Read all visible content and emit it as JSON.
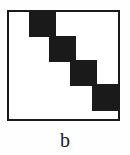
{
  "figure": {
    "caption": "b",
    "caption_font_size_px": 20,
    "caption_left_px": 0,
    "caption_top_px": 130,
    "background_color": "#fefefe"
  },
  "matrix": {
    "frame": {
      "x": 7,
      "y": 10,
      "width": 113,
      "height": 111,
      "border_width_px": 2,
      "border_color": "#1a1a1a",
      "fill_color": "#ffffff"
    },
    "block_color": "#1a1a1a",
    "block_count": 4,
    "blocks": [
      {
        "label": "block-1",
        "x": 29,
        "y": 11,
        "width": 27,
        "height": 26
      },
      {
        "label": "block-2",
        "x": 49,
        "y": 36,
        "width": 27,
        "height": 26
      },
      {
        "label": "block-3",
        "x": 70,
        "y": 60,
        "width": 27,
        "height": 26
      },
      {
        "label": "block-4",
        "x": 92,
        "y": 84,
        "width": 27,
        "height": 27
      }
    ]
  },
  "chart_data": {
    "type": "heatmap",
    "title": "b",
    "xlabel": "",
    "ylabel": "",
    "grid": false,
    "legend_position": "none",
    "xlim": [
      0,
      1
    ],
    "ylim": [
      0,
      1
    ],
    "categories": [
      "block-1",
      "block-2",
      "block-3",
      "block-4"
    ],
    "values": [
      1,
      1,
      1,
      1
    ],
    "blocks_normalized": [
      {
        "name": "block-1",
        "x0": 0.195,
        "x1": 0.434,
        "y0": 0.009,
        "y1": 0.243
      },
      {
        "name": "block-2",
        "x0": 0.372,
        "x1": 0.611,
        "y0": 0.234,
        "y1": 0.468
      },
      {
        "name": "block-3",
        "x0": 0.558,
        "x1": 0.796,
        "y0": 0.45,
        "y1": 0.685
      },
      {
        "name": "block-4",
        "x0": 0.752,
        "x1": 0.991,
        "y0": 0.667,
        "y1": 0.91
      }
    ]
  }
}
